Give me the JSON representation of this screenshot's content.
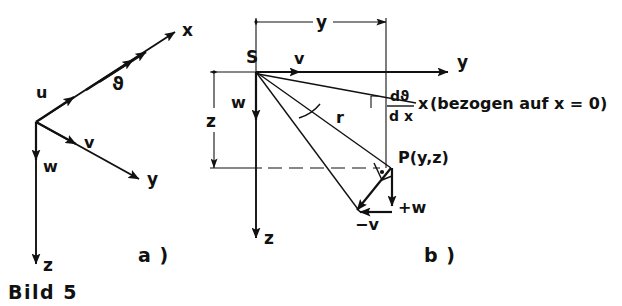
{
  "figure": {
    "caption": "Bild 5",
    "parts": [
      {
        "id": "a",
        "label": "a )"
      },
      {
        "id": "b",
        "label": "b )"
      }
    ]
  },
  "part_a": {
    "axes": [
      {
        "name": "x-axis",
        "label": "x"
      },
      {
        "name": "y-axis",
        "label": "y"
      },
      {
        "name": "z-axis",
        "label": "z"
      }
    ],
    "vectors": [
      {
        "name": "u-vector",
        "label": "u"
      },
      {
        "name": "v-vector",
        "label": "v"
      },
      {
        "name": "w-vector",
        "label": "w"
      }
    ],
    "rotation": {
      "name": "theta-double-arrow",
      "label": "ϑ"
    }
  },
  "part_b": {
    "origin_label": "S",
    "axes": [
      {
        "name": "y-axis",
        "label": "y"
      },
      {
        "name": "z-axis",
        "label": "z"
      }
    ],
    "dimensions": [
      {
        "name": "y-dimension",
        "label": "y"
      },
      {
        "name": "z-dimension",
        "label": "z"
      }
    ],
    "vectors": [
      {
        "name": "v-vector",
        "label": "v"
      },
      {
        "name": "w-vector",
        "label": "w"
      },
      {
        "name": "radius-line",
        "label": "r"
      },
      {
        "name": "minus-v-vector",
        "label": "−v"
      },
      {
        "name": "plus-w-vector",
        "label": "+w"
      }
    ],
    "point": {
      "name": "point-p",
      "label": "P(y,z)"
    },
    "formula": {
      "numerator": "dϑ",
      "denominator": "d x",
      "multiplier": "x",
      "note": "(bezogen auf x = 0)"
    }
  },
  "colors": {
    "ink": "#111111",
    "background": "#ffffff"
  }
}
